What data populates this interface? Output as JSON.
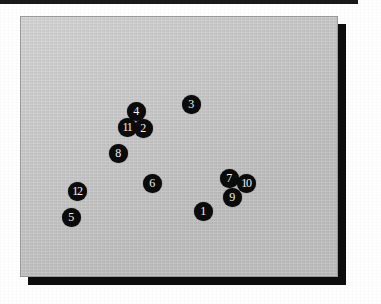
{
  "figure": {
    "kind": "scatter-map-panel",
    "panel_fill": "#c9c9c9",
    "panel_border": "#9a9a9a",
    "shadow_color": "#0d0d0d",
    "marker_fill": "#0b0b0b",
    "marker_label_color": "#f2f2f2",
    "scan_band_color": "#181818"
  },
  "chart_data": {
    "type": "scatter",
    "title": "",
    "subtitle": "",
    "xlabel": "",
    "ylabel": "",
    "grid": false,
    "legend": "none",
    "axis_ticks": [],
    "annotations": [],
    "note": "Twelve labelled black circular markers placed on a plain light-gray panel; axes and tick labels are not drawn.",
    "xlim": [
      0,
      318
    ],
    "ylim": [
      0,
      261
    ],
    "points": [
      {
        "label": "1",
        "x": 182,
        "y": 194
      },
      {
        "label": "2",
        "x": 122,
        "y": 111
      },
      {
        "label": "3",
        "x": 170,
        "y": 87
      },
      {
        "label": "4",
        "x": 115,
        "y": 94
      },
      {
        "label": "5",
        "x": 50,
        "y": 200
      },
      {
        "label": "6",
        "x": 131,
        "y": 166
      },
      {
        "label": "7",
        "x": 208,
        "y": 161
      },
      {
        "label": "8",
        "x": 97,
        "y": 136
      },
      {
        "label": "9",
        "x": 211,
        "y": 180
      },
      {
        "label": "10",
        "x": 225,
        "y": 166
      },
      {
        "label": "11",
        "x": 106,
        "y": 110
      },
      {
        "label": "12",
        "x": 56,
        "y": 174
      }
    ]
  },
  "markers": [
    {
      "label": "4",
      "left": 135,
      "top": 110,
      "wide": false
    },
    {
      "label": "3",
      "left": 190,
      "top": 103,
      "wide": false
    },
    {
      "label": "11",
      "left": 126,
      "top": 126,
      "wide": true
    },
    {
      "label": "2",
      "left": 142,
      "top": 127,
      "wide": false
    },
    {
      "label": "8",
      "left": 117,
      "top": 152,
      "wide": false
    },
    {
      "label": "6",
      "left": 151,
      "top": 182,
      "wide": false
    },
    {
      "label": "7",
      "left": 228,
      "top": 177,
      "wide": false
    },
    {
      "label": "10",
      "left": 245,
      "top": 182,
      "wide": true
    },
    {
      "label": "9",
      "left": 231,
      "top": 196,
      "wide": false
    },
    {
      "label": "12",
      "left": 76,
      "top": 190,
      "wide": true
    },
    {
      "label": "1",
      "left": 202,
      "top": 210,
      "wide": false
    },
    {
      "label": "5",
      "left": 70,
      "top": 216,
      "wide": false
    }
  ]
}
